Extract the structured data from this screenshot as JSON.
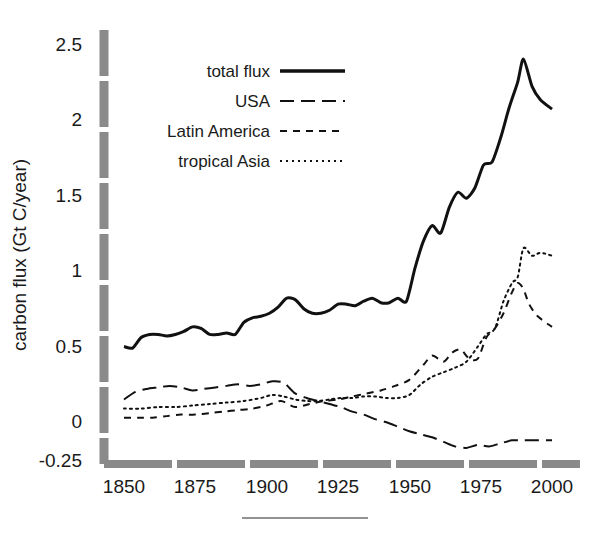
{
  "chart_data": {
    "type": "line",
    "title": "",
    "subtitle": "",
    "xlabel": "",
    "ylabel": "carbon flux (Gt C/year)",
    "xlim": [
      1850,
      2000
    ],
    "ylim": [
      -0.25,
      2.5
    ],
    "xticks": [
      "1850",
      "1875",
      "1900",
      "1925",
      "1950",
      "1975",
      "2000"
    ],
    "xtick_values": [
      1850,
      1875,
      1900,
      1925,
      1950,
      1975,
      2000
    ],
    "yticks": [
      "-0.25",
      "0",
      "0.5",
      "1",
      "1.5",
      "2",
      "2.5"
    ],
    "ytick_values": [
      -0.25,
      0,
      0.5,
      1,
      1.5,
      2,
      2.5
    ],
    "grid": false,
    "legend_position": "upper-left-inside",
    "series": [
      {
        "name": "total flux",
        "style": "solid",
        "linewidth": 3,
        "color": "#111111",
        "x": [
          1850,
          1853,
          1856,
          1859,
          1862,
          1865,
          1868,
          1871,
          1874,
          1877,
          1880,
          1883,
          1886,
          1889,
          1892,
          1895,
          1898,
          1901,
          1904,
          1907,
          1910,
          1913,
          1916,
          1919,
          1922,
          1925,
          1928,
          1931,
          1934,
          1937,
          1940,
          1943,
          1946,
          1949,
          1952,
          1955,
          1958,
          1961,
          1964,
          1967,
          1970,
          1973,
          1976,
          1979,
          1982,
          1985,
          1988,
          1990,
          1993,
          1996,
          2000
        ],
        "y": [
          0.5,
          0.49,
          0.56,
          0.58,
          0.58,
          0.57,
          0.58,
          0.6,
          0.63,
          0.62,
          0.58,
          0.58,
          0.59,
          0.58,
          0.66,
          0.69,
          0.7,
          0.72,
          0.76,
          0.82,
          0.81,
          0.75,
          0.72,
          0.72,
          0.74,
          0.78,
          0.78,
          0.77,
          0.8,
          0.82,
          0.79,
          0.79,
          0.82,
          0.8,
          1.02,
          1.2,
          1.3,
          1.25,
          1.42,
          1.52,
          1.48,
          1.55,
          1.7,
          1.72,
          1.88,
          2.08,
          2.25,
          2.4,
          2.22,
          2.13,
          2.07
        ]
      },
      {
        "name": "USA",
        "style": "long-dash",
        "linewidth": 2,
        "color": "#111111",
        "x": [
          1850,
          1854,
          1858,
          1862,
          1866,
          1870,
          1874,
          1878,
          1882,
          1886,
          1890,
          1894,
          1898,
          1902,
          1906,
          1910,
          1914,
          1918,
          1922,
          1926,
          1930,
          1934,
          1938,
          1942,
          1946,
          1950,
          1954,
          1958,
          1962,
          1966,
          1970,
          1974,
          1978,
          1982,
          1986,
          1990,
          1994,
          2000
        ],
        "y": [
          0.15,
          0.2,
          0.22,
          0.23,
          0.24,
          0.23,
          0.21,
          0.22,
          0.23,
          0.24,
          0.25,
          0.24,
          0.25,
          0.27,
          0.26,
          0.19,
          0.16,
          0.14,
          0.12,
          0.1,
          0.07,
          0.05,
          0.02,
          0.0,
          -0.03,
          -0.06,
          -0.08,
          -0.1,
          -0.13,
          -0.16,
          -0.17,
          -0.15,
          -0.16,
          -0.14,
          -0.12,
          -0.12,
          -0.12,
          -0.12
        ]
      },
      {
        "name": "Latin America",
        "style": "dash",
        "linewidth": 2,
        "color": "#111111",
        "x": [
          1850,
          1855,
          1860,
          1865,
          1870,
          1875,
          1880,
          1885,
          1890,
          1895,
          1900,
          1905,
          1910,
          1915,
          1920,
          1925,
          1930,
          1935,
          1940,
          1945,
          1950,
          1955,
          1958,
          1962,
          1965,
          1968,
          1971,
          1974,
          1977,
          1980,
          1983,
          1986,
          1988,
          1990,
          1992,
          1995,
          2000
        ],
        "y": [
          0.03,
          0.03,
          0.03,
          0.04,
          0.05,
          0.05,
          0.06,
          0.07,
          0.08,
          0.09,
          0.11,
          0.14,
          0.1,
          0.12,
          0.14,
          0.15,
          0.17,
          0.19,
          0.21,
          0.24,
          0.28,
          0.38,
          0.44,
          0.4,
          0.46,
          0.48,
          0.42,
          0.42,
          0.56,
          0.62,
          0.72,
          0.86,
          0.92,
          0.88,
          0.78,
          0.7,
          0.63
        ]
      },
      {
        "name": "tropical Asia",
        "style": "dot",
        "linewidth": 2,
        "color": "#111111",
        "x": [
          1850,
          1856,
          1862,
          1868,
          1874,
          1880,
          1886,
          1892,
          1898,
          1902,
          1906,
          1910,
          1914,
          1918,
          1922,
          1926,
          1930,
          1934,
          1938,
          1942,
          1946,
          1950,
          1954,
          1958,
          1962,
          1966,
          1970,
          1974,
          1977,
          1980,
          1983,
          1986,
          1988,
          1990,
          1993,
          1996,
          2000
        ],
        "y": [
          0.09,
          0.09,
          0.1,
          0.1,
          0.11,
          0.12,
          0.13,
          0.14,
          0.16,
          0.18,
          0.17,
          0.15,
          0.14,
          0.14,
          0.15,
          0.16,
          0.16,
          0.17,
          0.17,
          0.16,
          0.16,
          0.18,
          0.25,
          0.3,
          0.33,
          0.36,
          0.4,
          0.5,
          0.58,
          0.62,
          0.8,
          0.92,
          0.96,
          1.15,
          1.1,
          1.12,
          1.1
        ]
      }
    ]
  },
  "axis": {
    "ylabel": "carbon flux (Gt C/year)",
    "xtick_labels": [
      "1850",
      "1875",
      "1900",
      "1925",
      "1950",
      "1975",
      "2000"
    ],
    "ytick_labels": [
      "2.5",
      "2",
      "1.5",
      "1",
      "0.5",
      "0",
      "-0.25"
    ],
    "axis_color": "#8a8a8a"
  },
  "legend": {
    "entries": [
      {
        "label": "total flux",
        "style": "solid"
      },
      {
        "label": "USA",
        "style": "long-dash"
      },
      {
        "label": "Latin America",
        "style": "dash"
      },
      {
        "label": "tropical Asia",
        "style": "dot"
      }
    ]
  },
  "footer": {
    "rule_present": true
  },
  "colors": {
    "line": "#111111",
    "axis": "#8a8a8a",
    "background": "#ffffff",
    "text": "#1a1a1a"
  }
}
